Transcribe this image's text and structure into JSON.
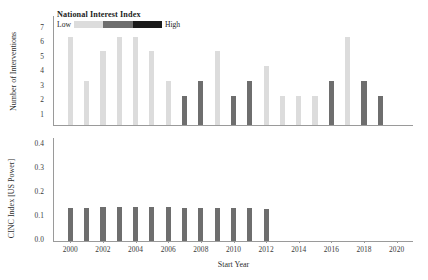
{
  "chart_data": {
    "type": "bar",
    "title": "",
    "xlabel": "Start Year",
    "xlim": [
      1999,
      2021
    ],
    "xticks": [
      2000,
      2002,
      2004,
      2006,
      2008,
      2010,
      2012,
      2014,
      2016,
      2018,
      2020
    ],
    "legend": {
      "title": "National Interest Index",
      "low_label": "Low",
      "high_label": "High",
      "colors": [
        "#dcdcdc",
        "#6e6e6e",
        "#1a1a1a"
      ],
      "position": "top-left-inside"
    },
    "panels": [
      {
        "id": "interventions",
        "ylabel": "Number of Interventions",
        "ylim": [
          0,
          7.4
        ],
        "yticks": [
          1,
          2,
          3,
          4,
          5,
          6,
          7
        ],
        "grid": false,
        "categories": [
          2000,
          2001,
          2002,
          2003,
          2004,
          2005,
          2006,
          2007,
          2008,
          2009,
          2010,
          2011,
          2012,
          2013,
          2014,
          2015,
          2016,
          2017,
          2018,
          2019
        ],
        "values": [
          6,
          3,
          5,
          6,
          6,
          5,
          3,
          2,
          3,
          5,
          2,
          3,
          4,
          2,
          2,
          2,
          3,
          6,
          3,
          2
        ],
        "bar_colors": [
          "#dcdcdc",
          "#dcdcdc",
          "#dcdcdc",
          "#dcdcdc",
          "#dcdcdc",
          "#dcdcdc",
          "#dcdcdc",
          "#6e6e6e",
          "#6e6e6e",
          "#dcdcdc",
          "#6e6e6e",
          "#6e6e6e",
          "#dcdcdc",
          "#dcdcdc",
          "#dcdcdc",
          "#dcdcdc",
          "#6e6e6e",
          "#dcdcdc",
          "#6e6e6e",
          "#6e6e6e"
        ],
        "interest_level": [
          "low",
          "low",
          "low",
          "low",
          "low",
          "low",
          "low",
          "high",
          "high",
          "low",
          "high",
          "high",
          "low",
          "low",
          "low",
          "low",
          "high",
          "low",
          "high",
          "high"
        ]
      },
      {
        "id": "cinc",
        "ylabel": "CINC Index [US Power]",
        "ylim": [
          0,
          0.44
        ],
        "yticks": [
          "0.0",
          "0.1",
          "0.2",
          "0.3",
          "0.4"
        ],
        "ytick_values": [
          0.0,
          0.1,
          0.2,
          0.3,
          0.4
        ],
        "grid": false,
        "categories": [
          2000,
          2001,
          2002,
          2003,
          2004,
          2005,
          2006,
          2007,
          2008,
          2009,
          2010,
          2011,
          2012
        ],
        "values": [
          0.142,
          0.143,
          0.145,
          0.146,
          0.145,
          0.145,
          0.144,
          0.143,
          0.142,
          0.141,
          0.14,
          0.139,
          0.138
        ],
        "bar_color": "#6e6e6e"
      }
    ]
  }
}
